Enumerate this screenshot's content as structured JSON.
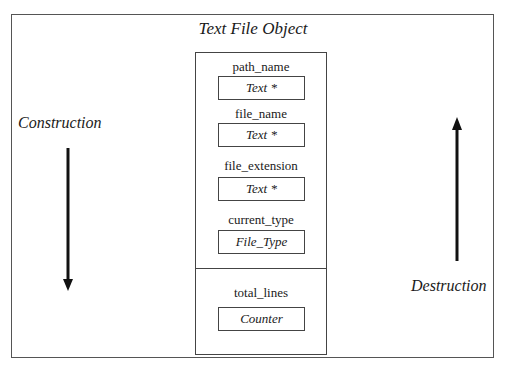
{
  "diagram": {
    "title": "Text File Object",
    "left_label": "Construction",
    "right_label": "Destruction",
    "fields": [
      {
        "name": "path_name",
        "type": "Text *"
      },
      {
        "name": "file_name",
        "type": "Text *"
      },
      {
        "name": "file_extension",
        "type": "Text *"
      },
      {
        "name": "current_type",
        "type": "File_Type"
      },
      {
        "name": "total_lines",
        "type": "Counter"
      }
    ],
    "arrows": [
      {
        "label": "Construction",
        "direction": "down"
      },
      {
        "label": "Destruction",
        "direction": "up"
      }
    ],
    "colors": {
      "line": "#444444",
      "arrow": "#111111",
      "background": "#ffffff"
    }
  }
}
